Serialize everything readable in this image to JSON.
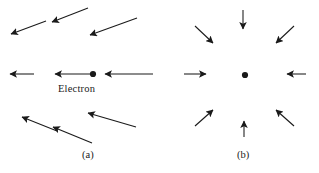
{
  "figure": {
    "type": "physics-field-vector-diagram",
    "background_color": "#ffffff",
    "stroke_color": "#1a1a1a",
    "panels": [
      {
        "id": "a",
        "caption": "(a)",
        "center_label": "Electron",
        "center_dot": {
          "x": 93,
          "y": 74,
          "r": 3.1
        },
        "description": "Electric field vectors of a point electron pointing inward toward the charge",
        "arrows": [
          {
            "name": "arrow-upper-left-outer",
            "x1": 46,
            "y1": 21,
            "x2": 11,
            "y2": 34
          },
          {
            "name": "arrow-upper-left-inner",
            "x1": 88,
            "y1": 8,
            "x2": 52,
            "y2": 22
          },
          {
            "name": "arrow-upper-right",
            "x1": 137,
            "y1": 18,
            "x2": 90,
            "y2": 35
          },
          {
            "name": "arrow-left-far",
            "x1": 34,
            "y1": 74,
            "x2": 10,
            "y2": 74
          },
          {
            "name": "arrow-left-near",
            "x1": 90,
            "y1": 74,
            "x2": 55,
            "y2": 74
          },
          {
            "name": "arrow-right",
            "x1": 153,
            "y1": 74,
            "x2": 105,
            "y2": 74
          },
          {
            "name": "arrow-lower-left",
            "x1": 57,
            "y1": 131,
            "x2": 22,
            "y2": 117
          },
          {
            "name": "arrow-lower-middle",
            "x1": 92,
            "y1": 143,
            "x2": 53,
            "y2": 127
          },
          {
            "name": "arrow-lower-right",
            "x1": 136,
            "y1": 127,
            "x2": 88,
            "y2": 113
          }
        ]
      },
      {
        "id": "b",
        "caption": "(b)",
        "center_label": "",
        "center_dot": {
          "x": 245,
          "y": 75,
          "r": 3.1
        },
        "description": "Eight short field vectors arranged radially pointing inward toward the central charge",
        "arrows": [
          {
            "name": "arrow-top",
            "x1": 243,
            "y1": 10,
            "x2": 243,
            "y2": 29
          },
          {
            "name": "arrow-bottom",
            "x1": 244,
            "y1": 137,
            "x2": 244,
            "y2": 121
          },
          {
            "name": "arrow-left",
            "x1": 184,
            "y1": 74,
            "x2": 206,
            "y2": 74
          },
          {
            "name": "arrow-right",
            "x1": 306,
            "y1": 74,
            "x2": 287,
            "y2": 74
          },
          {
            "name": "arrow-upper-left",
            "x1": 195,
            "y1": 26,
            "x2": 213,
            "y2": 43
          },
          {
            "name": "arrow-upper-right",
            "x1": 294,
            "y1": 26,
            "x2": 276,
            "y2": 43
          },
          {
            "name": "arrow-lower-left",
            "x1": 195,
            "y1": 126,
            "x2": 213,
            "y2": 110
          },
          {
            "name": "arrow-lower-right",
            "x1": 294,
            "y1": 126,
            "x2": 276,
            "y2": 110
          }
        ]
      }
    ]
  }
}
